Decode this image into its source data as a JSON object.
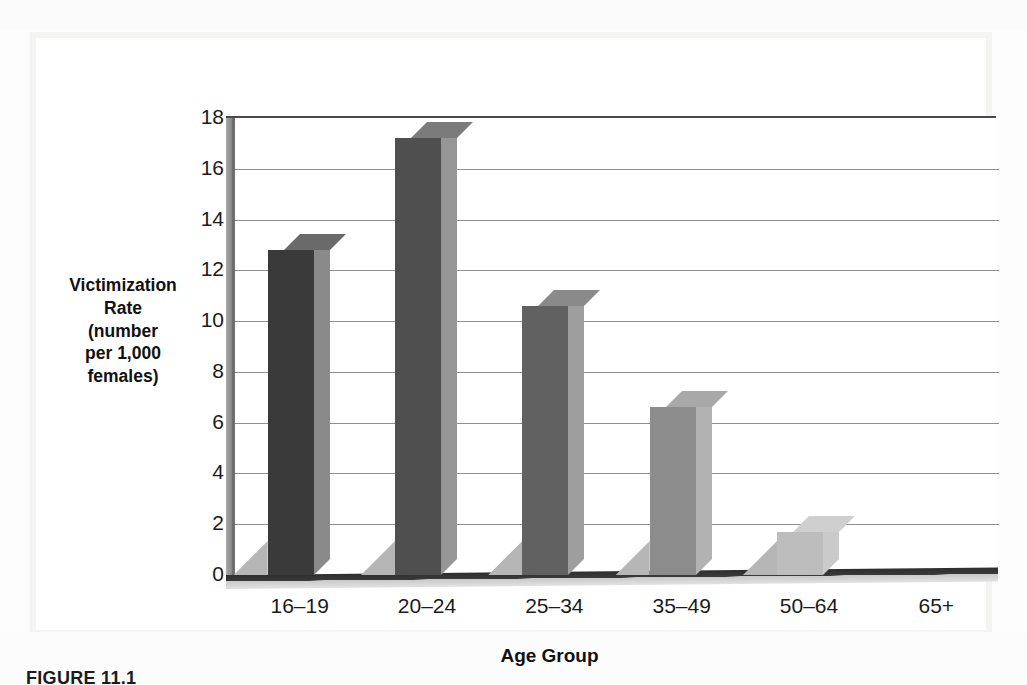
{
  "page": {
    "background_color": "#fdfdfd",
    "panel_color": "#f2f2f1",
    "canvas_color": "#ffffff"
  },
  "figure": {
    "caption_label": "FIGURE 11.1"
  },
  "chart_data": {
    "type": "bar",
    "title": "",
    "subtitle": "",
    "xlabel": "Age Group",
    "ylabel": "Victimization Rate (number per 1,000 females)",
    "ylabel_lines": [
      "Victimization",
      "Rate",
      "(number",
      "per 1,000",
      "females)"
    ],
    "categories": [
      "16–19",
      "20–24",
      "25–34",
      "35–49",
      "50–64",
      "65+"
    ],
    "values": [
      12.8,
      17.2,
      10.6,
      6.6,
      1.7,
      0
    ],
    "ylim": [
      0,
      18
    ],
    "ytick_values": [
      0,
      2,
      4,
      6,
      8,
      10,
      12,
      14,
      16,
      18
    ],
    "ytick_labels": [
      "0",
      "2",
      "4",
      "6",
      "8",
      "10",
      "12",
      "14",
      "16",
      "18"
    ],
    "grid": true,
    "legend": "none",
    "style": "3d-column",
    "bar_colors": [
      "#3a3a3a",
      "#4f4f4f",
      "#616161",
      "#8c8c8c",
      "#bdbdbd",
      "#d6d6d6"
    ],
    "bar_top_colors": [
      "#6a6a6a",
      "#7b7b7b",
      "#8a8a8a",
      "#a8a8a8",
      "#cfcfcf",
      "#e2e2e2"
    ],
    "bar_side_colors": [
      "#8a8a8a",
      "#969696",
      "#9e9e9e",
      "#b2b2b2",
      "#cacaca",
      "#dcdcdc"
    ]
  }
}
